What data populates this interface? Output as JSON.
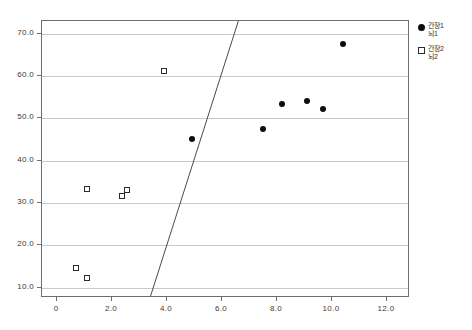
{
  "chart_data": {
    "type": "scatter",
    "title": "",
    "xlabel": "",
    "ylabel": "",
    "xlim": [
      -0.55,
      12.85
    ],
    "ylim": [
      7.6,
      73.0
    ],
    "grid": "horizontal",
    "legend_position": "right",
    "xticks": [
      "0",
      "2.0",
      "4.0",
      "6.0",
      "8.0",
      "10.0",
      "12.0"
    ],
    "xtick_values": [
      0,
      2,
      4,
      6,
      8,
      10,
      12
    ],
    "yticks": [
      "10.0",
      "20.0",
      "30.0",
      "40.0",
      "50.0",
      "60.0",
      "70.0"
    ],
    "ytick_values": [
      10,
      20,
      30,
      40,
      50,
      60,
      70
    ],
    "series": [
      {
        "name": "group-1",
        "marker": "filled-circle",
        "color": "#0d0d0d",
        "legend_line1": "간장1",
        "legend_line2": "뇌1",
        "points": [
          {
            "x": 4.9,
            "y": 45.2
          },
          {
            "x": 7.5,
            "y": 47.4
          },
          {
            "x": 8.2,
            "y": 53.3
          },
          {
            "x": 9.1,
            "y": 54.2
          },
          {
            "x": 9.7,
            "y": 52.2
          },
          {
            "x": 10.4,
            "y": 67.5
          }
        ]
      },
      {
        "name": "group-2",
        "marker": "open-square",
        "color": "#2b2b2b",
        "legend_line1": "간장2",
        "legend_line2": "뇌2",
        "points": [
          {
            "x": 0.7,
            "y": 14.6
          },
          {
            "x": 1.1,
            "y": 12.3
          },
          {
            "x": 1.1,
            "y": 33.4
          },
          {
            "x": 2.35,
            "y": 31.6
          },
          {
            "x": 2.55,
            "y": 33.2
          },
          {
            "x": 3.9,
            "y": 61.1
          }
        ]
      }
    ],
    "annotations": [
      {
        "name": "discriminant-line",
        "type": "line",
        "color": "#4a4a4a",
        "x1": 3.4,
        "y1": 8.0,
        "x2": 6.6,
        "y2": 73.0
      }
    ]
  },
  "legend": {
    "entries": [
      {
        "line1": "간장1",
        "line2": "뇌1",
        "marker": "filled-circle"
      },
      {
        "line1": "간장2",
        "line2": "뇌2",
        "marker": "open-square"
      }
    ]
  }
}
